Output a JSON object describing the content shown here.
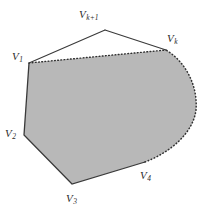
{
  "figure": {
    "canvas": {
      "width": 216,
      "height": 213
    },
    "colors": {
      "background": "#ffffff",
      "region_fill": "#b8b8b8",
      "stroke": "#3a3a3a",
      "dotted_stroke": "#303030",
      "label_text": "#2b2b2b"
    },
    "region": {
      "fill_label": "shaded convex region",
      "solid_edges": [
        "V1-V2",
        "V2-V3",
        "V3-V4"
      ],
      "dashed_edges": [
        "V1-Vk"
      ],
      "dotted_edges": [
        "V4-arc-Vk"
      ],
      "apex_edges": [
        "V1-Vk+1",
        "Vk+1-Vk"
      ]
    },
    "vertices": [
      {
        "id": "v1",
        "label": "V",
        "subscript": "1",
        "x": 29,
        "y": 63,
        "label_x": 12,
        "label_y": 51
      },
      {
        "id": "v2",
        "label": "V",
        "subscript": "2",
        "x": 24,
        "y": 135,
        "label_x": 5,
        "label_y": 128
      },
      {
        "id": "v3",
        "label": "V",
        "subscript": "3",
        "x": 72,
        "y": 184,
        "label_x": 66,
        "label_y": 193
      },
      {
        "id": "v4",
        "label": "V",
        "subscript": "4",
        "x": 145,
        "y": 162,
        "label_x": 140,
        "label_y": 170
      },
      {
        "id": "vk",
        "label": "V",
        "subscript": "k",
        "x": 166,
        "y": 50,
        "label_x": 167,
        "label_y": 33
      },
      {
        "id": "vk1",
        "label": "V",
        "subscript": "k+1",
        "x": 105,
        "y": 30,
        "label_x": 79,
        "label_y": 9
      }
    ],
    "arc": {
      "description": "dotted circular arc from V4 sweeping right and up to Vk",
      "rightmost_x": 196,
      "center_x": 135,
      "center_y": 108
    }
  }
}
